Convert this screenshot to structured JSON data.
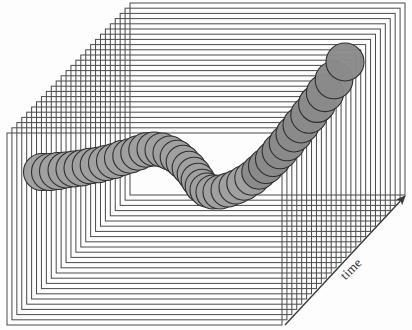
{
  "figure": {
    "kind": "3d-volume-diagram",
    "background_color": "#fdfdfd",
    "axis_label": "time",
    "axis_label_rotation_deg": -45,
    "arrow": {
      "name": "time-axis-arrow",
      "start": [
        285,
        325
      ],
      "end": [
        405,
        196
      ],
      "color": "#3a3a3a",
      "width": 1.4,
      "head_length": 11,
      "head_width": 7
    },
    "planes": {
      "name": "time-slice-plane-stack",
      "count": 26,
      "width": 275,
      "height": 192,
      "back_plane_origin": [
        7,
        133
      ],
      "front_plane_origin": [
        130,
        3
      ],
      "step_x": 4.92,
      "step_y": -5.2,
      "stroke_color": "#4a4a4a",
      "stroke_width": 1,
      "fill": "none"
    },
    "spheres": {
      "name": "tracked-object-sphere-chain",
      "count": 42,
      "fill_light": "#a0a0a0",
      "fill_dark": "#8a8a8a",
      "stroke_color": "#2e2e2e",
      "stroke_width": 1.1,
      "radius_min": 13,
      "radius_max": 19,
      "path_note": "descends left-to-right, dips to a valley near centre, then climbs steeply to the upper right",
      "points": [
        [
          42,
          172,
          18.5,
          0
        ],
        [
          50,
          172,
          18.5,
          1
        ],
        [
          58,
          171,
          18.5,
          2
        ],
        [
          66,
          170,
          18.0,
          3
        ],
        [
          74,
          169,
          18.0,
          4
        ],
        [
          82,
          168,
          18.0,
          5
        ],
        [
          90,
          166,
          17.8,
          6
        ],
        [
          98,
          165,
          17.8,
          7
        ],
        [
          106,
          163,
          17.5,
          8
        ],
        [
          114,
          161,
          17.5,
          9
        ],
        [
          122,
          158,
          17.5,
          10
        ],
        [
          130,
          156,
          17.2,
          11
        ],
        [
          138,
          153,
          17.2,
          12
        ],
        [
          146,
          150,
          17.2,
          13
        ],
        [
          154,
          149,
          17.0,
          14
        ],
        [
          162,
          150,
          17.0,
          15
        ],
        [
          170,
          153,
          17.0,
          16
        ],
        [
          177,
          157,
          16.8,
          17
        ],
        [
          183,
          162,
          16.8,
          18
        ],
        [
          189,
          168,
          16.8,
          19
        ],
        [
          194,
          174,
          16.8,
          20
        ],
        [
          198,
          180,
          16.8,
          21
        ],
        [
          202,
          186,
          16.8,
          22
        ],
        [
          207,
          190,
          17.0,
          23
        ],
        [
          213,
          192,
          17.0,
          24
        ],
        [
          220,
          192,
          17.0,
          25
        ],
        [
          228,
          190,
          17.0,
          26
        ],
        [
          236,
          187,
          17.0,
          27
        ],
        [
          244,
          183,
          17.2,
          28
        ],
        [
          252,
          178,
          17.2,
          29
        ],
        [
          259,
          172,
          17.2,
          30
        ],
        [
          266,
          166,
          17.5,
          31
        ],
        [
          273,
          159,
          17.5,
          32
        ],
        [
          280,
          151,
          17.8,
          33
        ],
        [
          287,
          143,
          17.8,
          34
        ],
        [
          294,
          134,
          18.0,
          35
        ],
        [
          301,
          125,
          18.0,
          36
        ],
        [
          309,
          115,
          18.2,
          37
        ],
        [
          317,
          104,
          18.4,
          38
        ],
        [
          325,
          93,
          18.6,
          39
        ],
        [
          334,
          80,
          18.8,
          40
        ],
        [
          345,
          62,
          19.0,
          41
        ]
      ]
    }
  }
}
